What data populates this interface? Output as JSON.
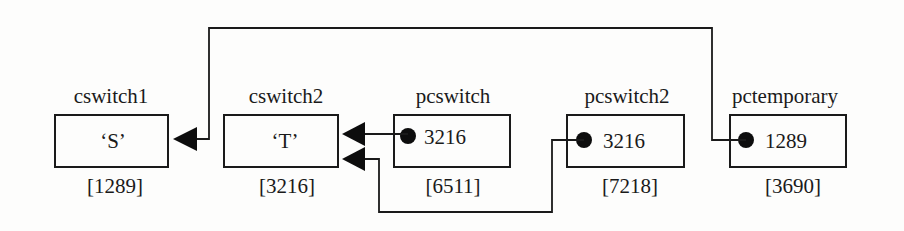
{
  "diagram": {
    "variables": [
      {
        "name": "cswitch1",
        "value": "‘S’",
        "address": "[1289]",
        "kind": "char"
      },
      {
        "name": "cswitch2",
        "value": "‘T’",
        "address": "[3216]",
        "kind": "char"
      },
      {
        "name": "pcswitch",
        "value": "3216",
        "address": "[6511]",
        "kind": "pointer"
      },
      {
        "name": "pcswitch2",
        "value": "3216",
        "address": "[7218]",
        "kind": "pointer"
      },
      {
        "name": "pctemporary",
        "value": "1289",
        "address": "[3690]",
        "kind": "pointer"
      }
    ],
    "connections": [
      {
        "from": "pcswitch",
        "to": "cswitch2"
      },
      {
        "from": "pcswitch2",
        "to": "cswitch2"
      },
      {
        "from": "pctemporary",
        "to": "cswitch1"
      }
    ]
  }
}
